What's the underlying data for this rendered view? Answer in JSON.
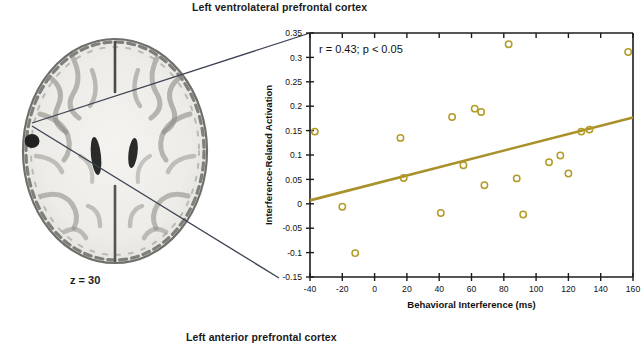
{
  "figure": {
    "title_top": "Left ventrolateral prefrontal cortex",
    "title_bottom": "Left anterior prefrontal cortex",
    "brain": {
      "slice_label": "z = 30",
      "image_name": "axial-brain-slice",
      "activation_blob_name": "activation-blob-left-vlpfc"
    }
  },
  "chart_data": {
    "type": "scatter",
    "title": "Left ventrolateral prefrontal cortex",
    "xlabel": "Behavioral Interference (ms)",
    "ylabel": "Interference-Related Activation",
    "annotation": "r = 0.43; p < 0.05",
    "xlim": [
      -40,
      160
    ],
    "ylim": [
      -0.15,
      0.35
    ],
    "xticks": [
      -40,
      -20,
      0,
      20,
      40,
      60,
      80,
      100,
      120,
      140,
      160
    ],
    "yticks": [
      -0.15,
      -0.1,
      -0.05,
      0,
      0.05,
      0.1,
      0.15,
      0.2,
      0.25,
      0.3,
      0.35
    ],
    "xtick_labels": [
      "-40",
      "-20",
      "0",
      "20",
      "40",
      "60",
      "80",
      "100",
      "120",
      "140",
      "160"
    ],
    "ytick_labels": [
      "-0.15",
      "-0.1",
      "-0.05",
      "0",
      "0.05",
      "0.1",
      "0.15",
      "0.2",
      "0.25",
      "0.3",
      "0.35"
    ],
    "grid": false,
    "legend": false,
    "marker": "open-circle",
    "marker_color": "#b39b26",
    "line_color": "#a8912a",
    "correlation_r": 0.43,
    "p_value_text": "p < 0.05",
    "trendline": {
      "type": "linear",
      "x": [
        -40,
        160
      ],
      "y": [
        0.007,
        0.177
      ]
    },
    "points": [
      {
        "x": -37,
        "y": 0.148
      },
      {
        "x": -20,
        "y": -0.006
      },
      {
        "x": -12,
        "y": -0.101
      },
      {
        "x": 16,
        "y": 0.135
      },
      {
        "x": 18,
        "y": 0.053
      },
      {
        "x": 41,
        "y": -0.019
      },
      {
        "x": 48,
        "y": 0.178
      },
      {
        "x": 55,
        "y": 0.079
      },
      {
        "x": 62,
        "y": 0.195
      },
      {
        "x": 66,
        "y": 0.188
      },
      {
        "x": 68,
        "y": 0.038
      },
      {
        "x": 83,
        "y": 0.327
      },
      {
        "x": 88,
        "y": 0.052
      },
      {
        "x": 92,
        "y": -0.022
      },
      {
        "x": 108,
        "y": 0.085
      },
      {
        "x": 115,
        "y": 0.099
      },
      {
        "x": 120,
        "y": 0.062
      },
      {
        "x": 128,
        "y": 0.148
      },
      {
        "x": 133,
        "y": 0.152
      },
      {
        "x": 157,
        "y": 0.311
      }
    ]
  }
}
